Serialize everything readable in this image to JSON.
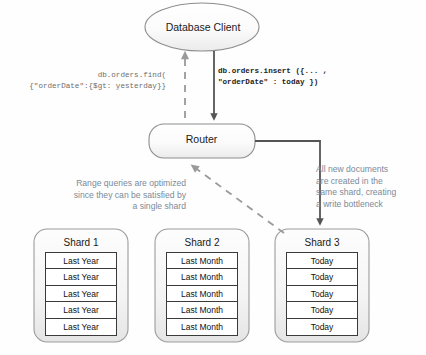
{
  "diagram": {
    "nodes": {
      "client": {
        "label": "Database Client",
        "shape": "ellipse"
      },
      "router": {
        "label": "Router",
        "shape": "rounded-rect"
      }
    },
    "shards": [
      {
        "title": "Shard 1",
        "documents": [
          "Last Year",
          "Last Year",
          "Last Year",
          "Last Year",
          "Last Year"
        ]
      },
      {
        "title": "Shard 2",
        "documents": [
          "Last Month",
          "Last Month",
          "Last Month",
          "Last Month",
          "Last Month"
        ]
      },
      {
        "title": "Shard 3",
        "documents": [
          "Today",
          "Today",
          "Today",
          "Today",
          "Today"
        ]
      }
    ],
    "code_annotations": {
      "find_query": "db.orders.find(\n{\"orderDate\":{$gt: yesterday}}",
      "insert_command": "db.orders.insert ({... ,\n\"orderDate\" : today })"
    },
    "notes": {
      "range_query": "Range queries are optimized\nsince they can be satisfied by\na single shard",
      "write_bottleneck": "All new documents\nare created in the\nsame shard, creating\na write bottleneck"
    },
    "edges": [
      {
        "name": "client-to-router-insert",
        "style": "solid",
        "arrow": "down",
        "from": "client",
        "to": "router"
      },
      {
        "name": "router-to-client-results",
        "style": "dashed",
        "arrow": "up",
        "from": "router",
        "to": "client"
      },
      {
        "name": "router-to-shard3-write",
        "style": "solid",
        "arrow": "down",
        "from": "router",
        "to": "shard-3"
      },
      {
        "name": "shard3-to-router-read",
        "style": "dashed",
        "arrow": "up-left",
        "from": "shard-3",
        "to": "router"
      }
    ],
    "colors": {
      "node_stroke": "#8d8d8d",
      "node_fill": "#f7f7f7",
      "doc_stroke": "#3a3a3a",
      "arrow_solid": "#555555",
      "arrow_dashed": "#9a9a9a",
      "note_text": "#7b8a9a",
      "code_text": "#1c1c1c"
    }
  }
}
